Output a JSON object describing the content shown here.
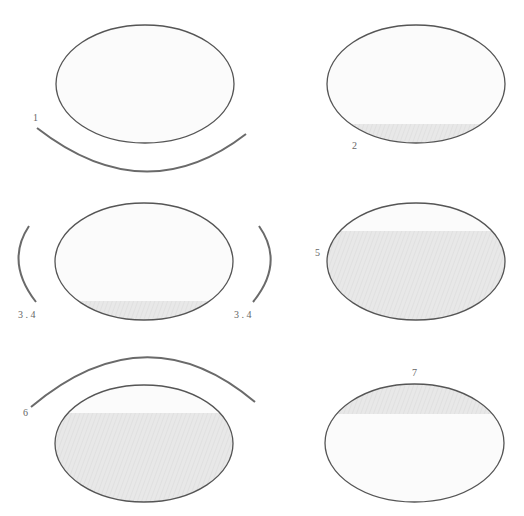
{
  "colors": {
    "background": "#ffffff",
    "outline": "#555555",
    "arc": "#6a6a6a",
    "empty_fill": "#fbfbfb",
    "shade_fill": "#e6e6e6",
    "label": "#666666"
  },
  "panels": [
    {
      "id": "1",
      "label": "1",
      "shaded_region": "none",
      "arc": "below"
    },
    {
      "id": "2",
      "label": "2",
      "shaded_region": "bottom segment"
    },
    {
      "id": "3-4",
      "label_left": "3 . 4",
      "label_right": "3 . 4",
      "shaded_region": "bottom segment",
      "arc": "left and right"
    },
    {
      "id": "5",
      "label": "5",
      "shaded_region": "most (below top segment)"
    },
    {
      "id": "6",
      "label": "6",
      "shaded_region": "most (below top segment)",
      "arc": "above"
    },
    {
      "id": "7",
      "label": "7",
      "shaded_region": "top segment"
    }
  ]
}
